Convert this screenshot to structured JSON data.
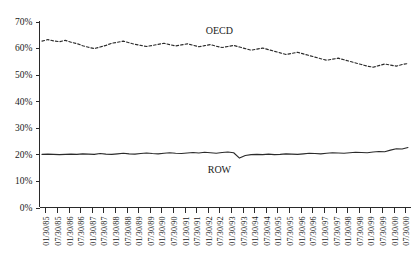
{
  "chart_data": {
    "type": "line",
    "title": "",
    "xlabel": "",
    "ylabel": "",
    "ylim": [
      0,
      70
    ],
    "yticks": [
      "0%",
      "10%",
      "20%",
      "30%",
      "40%",
      "50%",
      "60%",
      "70%"
    ],
    "ytick_values": [
      0,
      10,
      20,
      30,
      40,
      50,
      60,
      70
    ],
    "grid": false,
    "legend_position": "inline-annotation",
    "x": [
      "01/30/85",
      "07/30/85",
      "01/30/86",
      "07/30/86",
      "01/30/87",
      "07/30/87",
      "01/30/88",
      "07/30/88",
      "01/30/89",
      "07/30/89",
      "01/30/90",
      "07/30/90",
      "01/30/91",
      "07/30/91",
      "01/30/92",
      "07/30/92",
      "01/30/93",
      "07/30/93",
      "01/30/94",
      "07/30/94",
      "01/30/95",
      "07/30/95",
      "01/30/96",
      "07/30/96",
      "01/30/97",
      "07/30/97",
      "01/30/98",
      "07/30/98",
      "01/30/99",
      "07/30/99",
      "01/30/00",
      "07/30/00"
    ],
    "series": [
      {
        "name": "OECD",
        "style": "dashed",
        "color": "#2b2b2b",
        "annotation": "OECD",
        "values": [
          62.6,
          63.0,
          62.4,
          62.6,
          62.1,
          61.8,
          61.4,
          61.0,
          60.6,
          61.1,
          61.6,
          62.2,
          61.8,
          62.6,
          62.3,
          62.0,
          61.6,
          61.2,
          61.0,
          61.4,
          61.8,
          62.2,
          61.6,
          61.2,
          60.9,
          61.3,
          61.7,
          61.4,
          61.0,
          61.5,
          62.0,
          61.6
        ],
        "values_detail": [
          62.6,
          63.1,
          62.8,
          62.3,
          62.5,
          62.0,
          61.6,
          61.2,
          60.7,
          60.2,
          60.6,
          61.2,
          61.8,
          62.3,
          62.0,
          61.6,
          61.3,
          61.0,
          61.4,
          61.8,
          61.5,
          61.1,
          60.8,
          61.2,
          61.6,
          61.3,
          60.9,
          61.3,
          61.6,
          61.2,
          60.8,
          61.1
        ]
      },
      {
        "name": "ROW",
        "style": "solid",
        "color": "#2b2b2b",
        "annotation": "ROW",
        "values": [
          20.0,
          20.0,
          20.0,
          20.0,
          20.2,
          20.1,
          20.4,
          20.2,
          20.6,
          20.4,
          20.8,
          20.6,
          21.0,
          19.2,
          20.0,
          20.1,
          20.0,
          20.3,
          20.1,
          20.4,
          20.2,
          20.6,
          20.4,
          20.8,
          20.6,
          21.0,
          20.8,
          21.2,
          21.0,
          21.6,
          22.2,
          22.8
        ]
      }
    ],
    "annotations": [
      {
        "text": "OECD",
        "x_index": 15,
        "y_value": 66.5
      },
      {
        "text": "ROW",
        "x_index": 15,
        "y_value": 14.0
      }
    ]
  },
  "oecd_points": [
    62.6,
    63.2,
    62.7,
    62.4,
    62.9,
    62.2,
    61.7,
    60.9,
    60.3,
    59.8,
    60.4,
    61.0,
    61.8,
    62.2,
    62.6,
    62.0,
    61.4,
    61.0,
    60.6,
    61.0,
    61.4,
    61.8,
    61.3,
    60.8,
    61.2,
    61.6,
    61.1,
    60.5,
    60.9,
    61.3,
    60.7,
    60.2,
    60.6,
    61.0,
    60.4,
    59.8,
    59.2,
    59.6,
    60.0,
    59.4,
    58.8,
    58.2,
    57.6,
    58.0,
    58.4,
    57.8,
    57.2,
    56.6,
    56.0,
    55.4,
    55.8,
    56.2,
    55.6,
    55.0,
    54.4,
    53.8,
    53.2,
    52.8,
    53.4,
    54.0,
    53.6,
    53.2,
    53.8,
    54.2
  ],
  "row_points": [
    20.0,
    20.1,
    20.0,
    19.9,
    20.0,
    20.1,
    20.0,
    20.2,
    20.1,
    20.0,
    20.3,
    20.1,
    20.0,
    20.2,
    20.4,
    20.2,
    20.1,
    20.3,
    20.5,
    20.3,
    20.2,
    20.4,
    20.6,
    20.4,
    20.3,
    20.5,
    20.7,
    20.5,
    20.8,
    20.6,
    20.4,
    20.7,
    20.9,
    20.6,
    18.6,
    19.6,
    19.9,
    20.0,
    19.9,
    20.1,
    19.9,
    20.0,
    20.2,
    20.1,
    20.0,
    20.2,
    20.4,
    20.3,
    20.2,
    20.4,
    20.6,
    20.5,
    20.4,
    20.6,
    20.8,
    20.7,
    20.6,
    20.9,
    21.1,
    21.0,
    21.6,
    22.1,
    22.0,
    22.6
  ]
}
